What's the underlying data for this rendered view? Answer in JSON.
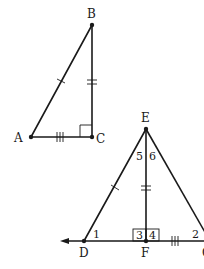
{
  "figure": {
    "triangle_abc": {
      "points": {
        "A": {
          "label": "A",
          "x": 31,
          "y": 137
        },
        "B": {
          "label": "B",
          "x": 92,
          "y": 25
        },
        "C": {
          "label": "C",
          "x": 92,
          "y": 137
        }
      },
      "right_angle_at": "C",
      "tick_marks": {
        "AB": 1,
        "BC": 2,
        "AC": 3
      }
    },
    "triangle_deg": {
      "points": {
        "E": {
          "label": "E",
          "x": 146,
          "y": 129
        },
        "D": {
          "label": "D",
          "x": 84,
          "y": 241
        },
        "F": {
          "label": "F",
          "x": 146,
          "y": 241
        },
        "G": {
          "label": "G",
          "x": 210,
          "y": 241
        }
      },
      "angle_labels": {
        "a1": "1",
        "a2": "2",
        "a3": "3",
        "a4": "4",
        "a5": "5",
        "a6": "6"
      },
      "tick_marks": {
        "DE": 1,
        "EF": 2,
        "FG": 3
      },
      "right_angles_at": "F",
      "arrow_direction": "left"
    }
  }
}
